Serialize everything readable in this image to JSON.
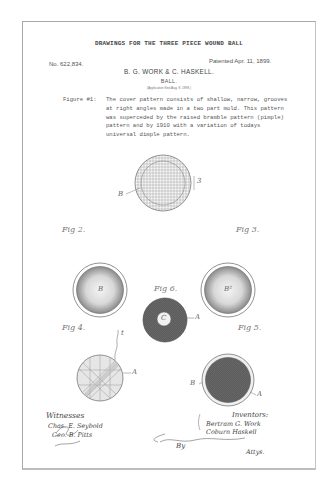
{
  "document": {
    "title": "DRAWINGS FOR THE THREE PIECE WOUND BALL",
    "patent_number": "No. 622,834.",
    "patent_date": "Patented Apr. 11, 1899.",
    "inventors_header": "B. G. WORK & C. HASKELL.",
    "subject": "BALL.",
    "application_note": "(Application filed Aug. 8, 1898.)",
    "caption": {
      "label": "Figure #1:",
      "body": "The cover pattern consists of shallow, narrow, grooves at right angles made in a two part mold. This pattern was superceded by the raised bramble pattern (pimple) pattern and by 1910 with a variation of todays universal dimple pattern."
    }
  },
  "figures": {
    "fig1": {
      "ref_b": "B",
      "ref_s": "3"
    },
    "fig2": {
      "label": "Fig 2.",
      "ref": "B"
    },
    "fig3": {
      "label": "Fig 3.",
      "ref": "B²"
    },
    "fig4": {
      "label": "Fig 4.",
      "ref_a": "A",
      "ref_t": "t"
    },
    "fig5": {
      "label": "Fig 5.",
      "ref_b": "B",
      "ref_a": "A"
    },
    "fig6": {
      "label": "Fig 6.",
      "ref_c": "C",
      "ref_a": "A"
    }
  },
  "signatures": {
    "witnesses_label": "Witnesses",
    "witnesses": [
      "Chas. E. Seybold",
      "Geo. B. Pitts"
    ],
    "inventors_label": "Inventors:",
    "inventors": [
      "Bertram G. Work",
      "Coburn Haskell"
    ],
    "by_label": "By",
    "attorney": "Attys."
  }
}
